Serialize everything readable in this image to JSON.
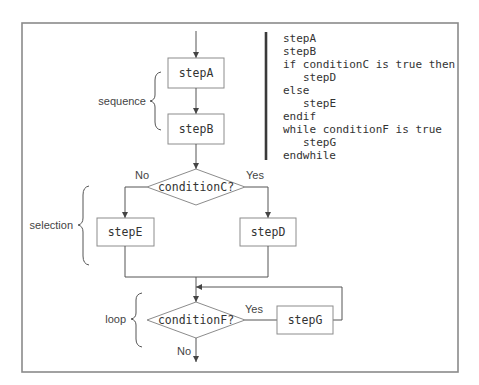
{
  "diagram": {
    "type": "flowchart",
    "nodes": {
      "stepA": {
        "label": "stepA",
        "shape": "rectangle"
      },
      "stepB": {
        "label": "stepB",
        "shape": "rectangle"
      },
      "conditionC": {
        "label": "conditionC?",
        "shape": "diamond"
      },
      "stepE": {
        "label": "stepE",
        "shape": "rectangle"
      },
      "stepD": {
        "label": "stepD",
        "shape": "rectangle"
      },
      "conditionF": {
        "label": "conditionF?",
        "shape": "diamond"
      },
      "stepG": {
        "label": "stepG",
        "shape": "rectangle"
      }
    },
    "edge_labels": {
      "conditionC_no": "No",
      "conditionC_yes": "Yes",
      "conditionF_yes": "Yes",
      "conditionF_no": "No"
    },
    "edges": [
      {
        "from": "start",
        "to": "stepA"
      },
      {
        "from": "stepA",
        "to": "stepB"
      },
      {
        "from": "stepB",
        "to": "conditionC"
      },
      {
        "from": "conditionC",
        "to": "stepE",
        "label": "No"
      },
      {
        "from": "conditionC",
        "to": "stepD",
        "label": "Yes"
      },
      {
        "from": "stepE",
        "to": "conditionF"
      },
      {
        "from": "stepD",
        "to": "conditionF"
      },
      {
        "from": "conditionF",
        "to": "stepG",
        "label": "Yes"
      },
      {
        "from": "stepG",
        "to": "conditionF"
      },
      {
        "from": "conditionF",
        "to": "end",
        "label": "No"
      }
    ],
    "groups": {
      "sequence": "sequence",
      "selection": "selection",
      "loop": "loop"
    },
    "pseudocode": [
      "stepA",
      "stepB",
      "if conditionC is true then",
      "   stepD",
      "else",
      "   stepE",
      "endif",
      "while conditionF is true",
      "   stepG",
      "endwhile"
    ]
  }
}
